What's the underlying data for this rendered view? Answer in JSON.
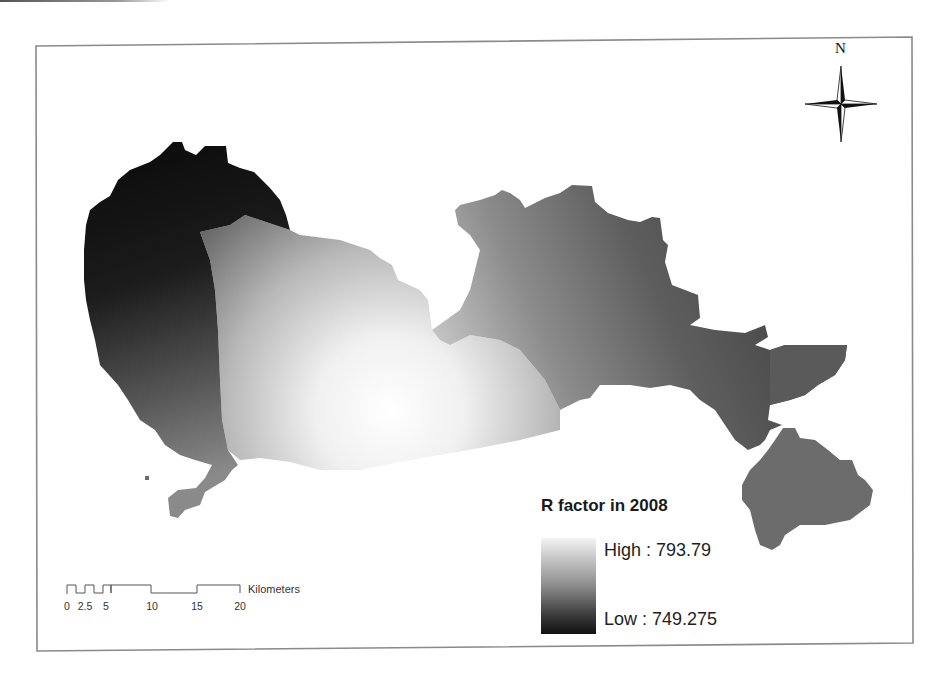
{
  "map": {
    "title": "R factor in 2008",
    "north_arrow": {
      "label": "N",
      "icon": "north-arrow-compass-star-icon"
    },
    "legend": {
      "title": "R factor in 2008",
      "high_label": "High : 793.79",
      "low_label": "Low : 749.275",
      "high_value": 793.79,
      "low_value": 749.275,
      "ramp_colors": {
        "high": "#f4f4f4",
        "low": "#111111"
      }
    },
    "scale_bar": {
      "unit": "Kilometers",
      "ticks": [
        "0",
        "2.5",
        "5",
        "10",
        "15",
        "20"
      ]
    },
    "colors": {
      "frame": "#8a8a8a",
      "darkest_region": "#141414",
      "mid_gray_region": "#6e6e6e",
      "lightest_region": "#f8f8f8"
    }
  }
}
